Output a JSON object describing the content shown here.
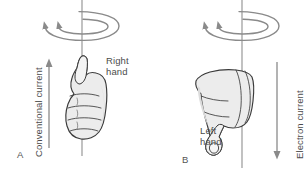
{
  "figure": {
    "width": 308,
    "height": 179,
    "background": "#ffffff"
  },
  "colors": {
    "text": "#4c4c4c",
    "outline": "#3a3a3a",
    "hand_fill": "#ececec",
    "hand_shade": "#dcdcdc",
    "axis_line": "#8f8f8f",
    "arrow_gray": "#8a8a8a",
    "loop_arrow": "#8a8a8a"
  },
  "panels": [
    {
      "id": "A",
      "letter": "A",
      "hand_label": "Right\nhand",
      "hand_label_line1": "Right",
      "hand_label_line2": "hand",
      "current_label": "Conventional current",
      "current_direction": "up",
      "hand": "right-hand-thumb-up",
      "field_rotation": "clockwise-viewed-from-above"
    },
    {
      "id": "B",
      "letter": "B",
      "hand_label": "Left\nhand",
      "hand_label_line1": "Left",
      "hand_label_line2": "hand",
      "current_label": "Electron current",
      "current_direction": "down",
      "hand": "left-hand-thumb-down",
      "field_rotation": "clockwise-viewed-from-above"
    }
  ],
  "caption_fragment": "",
  "icons": {
    "field_loop": "circular-field-arrow-icon",
    "current_arrow_up": "arrow-up-icon",
    "current_arrow_down": "arrow-down-icon",
    "wire": "vertical-wire-line"
  }
}
